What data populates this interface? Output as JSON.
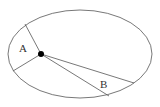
{
  "diagram": {
    "type": "kepler-second-law",
    "colors": {
      "line": "#555555",
      "focus": "#000000",
      "background": "#ffffff"
    },
    "ellipse": {
      "cx": 80,
      "cy": 54,
      "rx": 72,
      "ry": 44
    },
    "focus": {
      "x": 41,
      "y": 54,
      "r": 3
    },
    "regions": [
      {
        "label": "A",
        "label_pos": [
          23,
          52
        ],
        "ray1": [
          25,
          24
        ],
        "ray2": [
          13,
          71
        ]
      },
      {
        "label": "B",
        "label_pos": [
          100,
          88
        ],
        "ray1": [
          134,
          83
        ],
        "ray2": [
          109,
          96
        ]
      }
    ]
  }
}
